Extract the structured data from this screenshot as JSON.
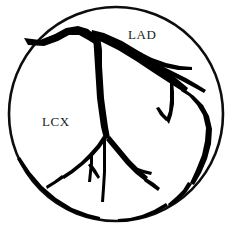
{
  "figure": {
    "kind": "coronary-artery-angiogram-diagram",
    "background_color": "#ffffff",
    "ink_color": "#000000",
    "boundary": {
      "shape": "circle",
      "center_x": 116,
      "center_y": 114,
      "radius": 107,
      "stroke_color": "#0d0d0d",
      "stroke_width": 2.6,
      "fill_color": "#ffffff"
    },
    "labels": [
      {
        "id": "lad",
        "text": "LAD",
        "x": 128,
        "y": 39,
        "font_size": 13,
        "color": "#1a1a1a"
      },
      {
        "id": "lcx",
        "text": "LCX",
        "x": 42,
        "y": 126,
        "font_size": 13,
        "color": "#1a1a1a"
      }
    ],
    "vessels": [
      {
        "id": "left-main-ostium",
        "name": "left-main-stem",
        "type": "filled",
        "path": "M 24 38 L 40 40 L 55 34 L 66 28 L 78 26 L 88 29 L 95 35 L 99 41 L 96 45 L 88 40 L 79 35 L 69 35 L 58 41 L 44 46 L 28 45 Z"
      },
      {
        "id": "lad-proximal",
        "name": "left-anterior-descending-proximal",
        "type": "filled",
        "path": "M 92 30 L 104 33 L 122 41 L 142 53 L 160 66 L 176 78 L 188 88 L 185 93 L 171 84 L 154 73 L 136 61 L 118 50 L 102 42 L 90 37 Z"
      },
      {
        "id": "lad-mid",
        "name": "left-anterior-descending-mid",
        "type": "filled",
        "path": "M 183 88 L 194 96 L 203 105 L 209 116 L 212 129 L 211 144 L 207 159 L 201 173 L 194 185 L 190 183 L 196 170 L 202 155 L 205 141 L 206 128 L 203 115 L 197 105 L 189 96 L 181 91 Z"
      },
      {
        "id": "lad-distal",
        "name": "left-anterior-descending-distal",
        "type": "filled",
        "path": "M 192 184 L 186 193 L 178 201 L 169 207 L 168 204 L 176 197 L 183 190 L 188 182 Z"
      },
      {
        "id": "diagonal-branch-1",
        "name": "first-diagonal-branch",
        "type": "filled",
        "path": "M 140 52 L 152 58 L 166 63 L 180 66 L 192 67 L 192 70 L 178 70 L 163 67 L 149 62 L 137 56 Z"
      },
      {
        "id": "diagonal-branch-2",
        "name": "second-diagonal-branch",
        "type": "filled",
        "path": "M 158 64 L 172 71 L 186 78 L 198 85 L 206 90 L 204 93 L 195 88 L 182 81 L 168 74 L 155 68 Z"
      },
      {
        "id": "septal-branch",
        "name": "septal-perforator-branch",
        "type": "filled",
        "path": "M 173 80 L 174 92 L 174 104 L 172 115 L 169 124 L 166 120 L 169 111 L 170 100 L 170 89 L 170 80 Z"
      },
      {
        "id": "septal-branch-tip",
        "name": "septal-perforator-tip",
        "type": "filled",
        "path": "M 166 121 L 160 115 L 156 108 L 159 107 L 164 114 L 169 119 Z"
      },
      {
        "id": "lcx-trunk",
        "name": "left-circumflex-trunk",
        "type": "filled",
        "path": "M 93 35 L 100 36 L 102 50 L 102 66 L 103 82 L 104 98 L 106 113 L 108 127 L 110 138 L 104 139 L 101 127 L 99 113 L 97 98 L 96 82 L 95 66 L 94 50 Z"
      },
      {
        "id": "obtuse-marginal-1",
        "name": "obtuse-marginal-branch-one",
        "type": "filled",
        "path": "M 110 136 L 120 148 L 130 160 L 140 170 L 148 177 L 145 181 L 136 174 L 126 164 L 116 152 L 106 140 Z"
      },
      {
        "id": "obtuse-marginal-1-tip",
        "name": "obtuse-marginal-one-tip",
        "type": "filled",
        "path": "M 146 178 L 154 183 L 160 188 L 158 191 L 151 186 L 144 181 Z"
      },
      {
        "id": "om1-side-twig",
        "name": "obtuse-marginal-one-side-twig",
        "type": "filled",
        "path": "M 135 167 L 144 170 L 152 172 L 151 175 L 142 173 L 133 170 Z"
      },
      {
        "id": "obtuse-marginal-2",
        "name": "obtuse-marginal-branch-two",
        "type": "filled",
        "path": "M 107 138 L 100 148 L 92 157 L 83 165 L 73 173 L 64 179 L 62 176 L 71 170 L 81 162 L 89 154 L 97 145 L 103 136 Z"
      },
      {
        "id": "om2-distal",
        "name": "obtuse-marginal-two-distal",
        "type": "filled",
        "path": "M 64 178 L 55 184 L 47 189 L 46 186 L 54 181 L 62 175 Z"
      },
      {
        "id": "ramus-twig",
        "name": "ramus-intermedius-twig",
        "type": "filled",
        "path": "M 93 154 L 93 163 L 92 172 L 91 182 L 88 182 L 89 172 L 90 163 L 90 154 Z"
      },
      {
        "id": "ramus-twig-branch",
        "name": "ramus-intermedius-small-branch",
        "type": "filled",
        "path": "M 91 163 L 96 170 L 100 177 L 98 179 L 93 172 L 88 165 Z"
      },
      {
        "id": "posterolateral-branch",
        "name": "posterolateral-branch",
        "type": "filled",
        "path": "M 106 139 L 106 155 L 106 172 L 105 188 L 104 202 L 101 202 L 102 188 L 103 172 L 103 155 L 103 139 Z"
      },
      {
        "id": "lower-left-collateral",
        "name": "lower-left-collateral-vessel",
        "type": "filled",
        "path": "M 20 157 L 30 172 L 42 186 L 56 198 L 72 208 L 88 214 L 100 217 L 100 220 L 86 217 L 69 211 L 53 200 L 39 188 L 27 174 L 17 159 Z"
      },
      {
        "id": "lower-right-collateral",
        "name": "lower-right-collateral-vessel",
        "type": "filled",
        "path": "M 168 206 L 156 213 L 143 218 L 130 221 L 118 222 L 118 219 L 130 218 L 142 215 L 154 210 L 166 203 Z"
      }
    ]
  }
}
